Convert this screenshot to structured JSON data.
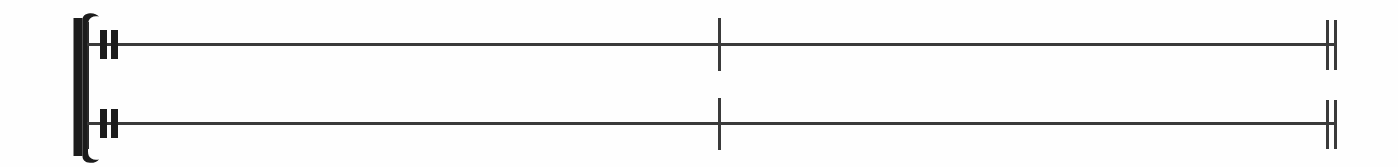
{
  "document": {
    "type": "music-notation-fragment",
    "background_color": "#fefefe",
    "ink_color": "#1c1c1c",
    "width": 1398,
    "height": 167,
    "caption": ""
  },
  "bracket": {
    "name": "system-bracket",
    "description": "Thick vertical bracket with curved serifs spanning both staves",
    "color": "#1c1c1c",
    "x": 73,
    "y": 12,
    "width": 26,
    "height": 148,
    "stroke_width": 9
  },
  "system_start_barline": {
    "name": "system-start-barline",
    "color": "#2a2a2a",
    "x": 87,
    "y": 22,
    "width": 2,
    "height": 127
  },
  "staves": [
    {
      "index": 1,
      "name": "staff-upper",
      "line_y": 44,
      "line_x_start": 87,
      "line_x_end": 1337,
      "line_thickness": 3,
      "line_color": "#3a3a3a",
      "heavy_bars": [
        {
          "name": "heavy-bar-1",
          "x": 100,
          "width": 7,
          "y": 30,
          "height": 29,
          "color": "#1c1c1c"
        },
        {
          "name": "heavy-bar-2",
          "x": 111,
          "width": 7,
          "y": 30,
          "height": 29,
          "color": "#1c1c1c"
        }
      ],
      "mid_barline": {
        "name": "mid-barline",
        "x": 718,
        "width": 3,
        "y": 18,
        "height": 53,
        "color": "#3a3a3a"
      },
      "end_barlines": [
        {
          "name": "end-barline-1",
          "x": 1326,
          "width": 3,
          "y": 20,
          "height": 50,
          "color": "#3a3a3a"
        },
        {
          "name": "end-barline-2",
          "x": 1334,
          "width": 3,
          "y": 20,
          "height": 50,
          "color": "#3a3a3a"
        }
      ]
    },
    {
      "index": 2,
      "name": "staff-lower",
      "line_y": 123,
      "line_x_start": 87,
      "line_x_end": 1337,
      "line_thickness": 3,
      "line_color": "#3a3a3a",
      "heavy_bars": [
        {
          "name": "heavy-bar-1",
          "x": 100,
          "width": 7,
          "y": 109,
          "height": 29,
          "color": "#1c1c1c"
        },
        {
          "name": "heavy-bar-2",
          "x": 111,
          "width": 7,
          "y": 109,
          "height": 29,
          "color": "#1c1c1c"
        }
      ],
      "mid_barline": {
        "name": "mid-barline",
        "x": 718,
        "width": 3,
        "y": 98,
        "height": 52,
        "color": "#3a3a3a"
      },
      "end_barlines": [
        {
          "name": "end-barline-1",
          "x": 1326,
          "width": 3,
          "y": 100,
          "height": 49,
          "color": "#3a3a3a"
        },
        {
          "name": "end-barline-2",
          "x": 1334,
          "width": 3,
          "y": 100,
          "height": 49,
          "color": "#3a3a3a"
        }
      ]
    }
  ]
}
